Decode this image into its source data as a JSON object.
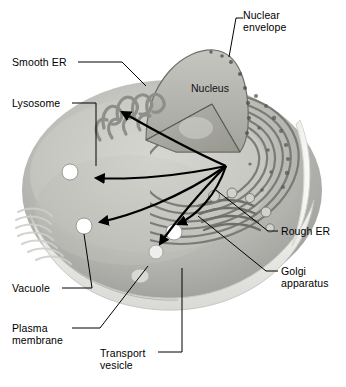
{
  "figure": {
    "type": "biology-diagram",
    "background_color": "#ffffff",
    "line_color": "#000000",
    "palette": {
      "cell_light": "#e8e8e6",
      "cell_mid": "#b9b9b6",
      "cell_dark": "#8a8a87",
      "nucleus": "#b2b2ae",
      "membrane_pale": "#f0f0ee",
      "vesicle_white": "#ffffff"
    }
  },
  "interior_labels": [
    {
      "name": "nucleus",
      "text": "Nucleus",
      "x": 191,
      "y": 82
    }
  ],
  "labels": [
    {
      "name": "nuclear-envelope",
      "text": "Nuclear\nenvelope",
      "lines": [
        "Nuclear",
        "envelope"
      ],
      "side": "right",
      "x": 243,
      "y": 10
    },
    {
      "name": "smooth-er",
      "text": "Smooth ER",
      "lines": [
        "Smooth ER"
      ],
      "side": "left",
      "x": 12,
      "y": 57
    },
    {
      "name": "lysosome",
      "text": "Lysosome",
      "lines": [
        "Lysosome"
      ],
      "side": "left",
      "x": 12,
      "y": 98
    },
    {
      "name": "rough-er",
      "text": "Rough ER",
      "lines": [
        "Rough ER"
      ],
      "side": "right",
      "x": 281,
      "y": 226
    },
    {
      "name": "golgi-apparatus",
      "text": "Golgi\napparatus",
      "lines": [
        "Golgi",
        "apparatus"
      ],
      "side": "right",
      "x": 281,
      "y": 266
    },
    {
      "name": "vacuole",
      "text": "Vacuole",
      "lines": [
        "Vacuole"
      ],
      "side": "left",
      "x": 12,
      "y": 283
    },
    {
      "name": "plasma-membrane",
      "text": "Plasma\nmembrane",
      "lines": [
        "Plasma",
        "membrane"
      ],
      "side": "left",
      "x": 12,
      "y": 323
    },
    {
      "name": "transport-vesicle",
      "text": "Transport\nvesicle",
      "lines": [
        "Transport",
        "vesicle"
      ],
      "side": "left",
      "x": 100,
      "y": 348
    }
  ],
  "structures": [
    {
      "name": "nucleus",
      "note": "cut-away dome, wedge removed"
    },
    {
      "name": "nuclear-envelope",
      "note": "pored double membrane at dome rim"
    },
    {
      "name": "smooth-er",
      "note": "tubular looping network, upper left"
    },
    {
      "name": "rough-er",
      "note": "concentric ribosome-studded sheets, right"
    },
    {
      "name": "golgi-apparatus",
      "note": "stacked cisternae with vesicles, lower right"
    },
    {
      "name": "lysosome",
      "note": "white vesicle, left"
    },
    {
      "name": "vacuole",
      "note": "white vesicle, lower left"
    },
    {
      "name": "transport-vesicle",
      "note": "vesicles budding at plasma membrane"
    },
    {
      "name": "plasma-membrane",
      "note": "pale outer band around cell base"
    }
  ],
  "flow_arrows": {
    "name": "transport-flow-arrows",
    "count": 5,
    "hub": {
      "x": 226,
      "y": 166
    },
    "note": "curved black arrows radiating from rough ER toward smooth ER, lysosome, vacuole and vesicles"
  }
}
